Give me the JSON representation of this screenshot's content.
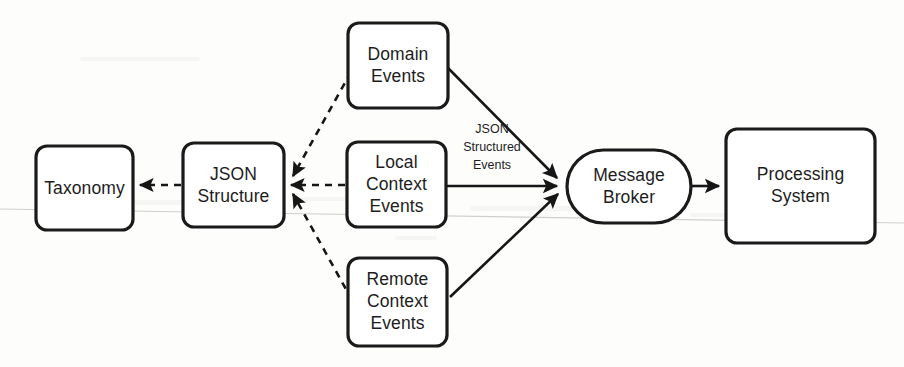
{
  "diagram": {
    "type": "flow-diagram",
    "canvas": {
      "width": 904,
      "height": 367,
      "background": "#fdfdfc"
    },
    "stroke_color": "#161616",
    "fill_color": "#ffffff",
    "nodes": [
      {
        "id": "taxonomy",
        "label": "Taxonomy",
        "lines": [
          "Taxonomy"
        ],
        "shape": "rounded-rect",
        "x": 36,
        "y": 146,
        "w": 97,
        "h": 84
      },
      {
        "id": "json_structure",
        "label": "JSON Structure",
        "lines": [
          "JSON",
          "Structure"
        ],
        "shape": "rounded-rect",
        "x": 183,
        "y": 143,
        "w": 101,
        "h": 84
      },
      {
        "id": "domain_events",
        "label": "Domain Events",
        "lines": [
          "Domain",
          "Events"
        ],
        "shape": "rounded-rect",
        "x": 348,
        "y": 23,
        "w": 100,
        "h": 85
      },
      {
        "id": "local_context_events",
        "label": "Local Context Events",
        "lines": [
          "Local",
          "Context",
          "Events"
        ],
        "shape": "rounded-rect",
        "x": 347,
        "y": 142,
        "w": 99,
        "h": 85
      },
      {
        "id": "remote_context_events",
        "label": "Remote Context Events",
        "lines": [
          "Remote",
          "Context",
          "Events"
        ],
        "shape": "rounded-rect",
        "x": 348,
        "y": 258,
        "w": 99,
        "h": 88
      },
      {
        "id": "message_broker",
        "label": "Message Broker",
        "lines": [
          "Message",
          "Broker"
        ],
        "shape": "stadium",
        "x": 567,
        "y": 150,
        "w": 124,
        "h": 73
      },
      {
        "id": "processing_system",
        "label": "Processing System",
        "lines": [
          "Processing",
          "System"
        ],
        "shape": "rounded-rect",
        "x": 726,
        "y": 129,
        "w": 149,
        "h": 114
      }
    ],
    "edges": [
      {
        "id": "e1",
        "from": "json_structure",
        "to": "taxonomy",
        "style": "dashed",
        "label": ""
      },
      {
        "id": "e2",
        "from": "local_context_events",
        "to": "json_structure",
        "style": "dashed",
        "label": ""
      },
      {
        "id": "e3",
        "from": "domain_events",
        "to": "json_structure",
        "style": "dashed",
        "label": ""
      },
      {
        "id": "e4",
        "from": "remote_context_events",
        "to": "json_structure",
        "style": "dashed",
        "label": ""
      },
      {
        "id": "e5",
        "from": "domain_events",
        "to": "message_broker",
        "style": "solid",
        "label": ""
      },
      {
        "id": "e6",
        "from": "local_context_events",
        "to": "message_broker",
        "style": "solid",
        "label": "JSON Structured Events"
      },
      {
        "id": "e7",
        "from": "remote_context_events",
        "to": "message_broker",
        "style": "solid",
        "label": ""
      },
      {
        "id": "e8",
        "from": "message_broker",
        "to": "processing_system",
        "style": "solid",
        "label": ""
      }
    ],
    "edge_labels": [
      {
        "id": "json_structured_events_label",
        "lines": [
          "JSON",
          "Structured",
          "Events"
        ],
        "x": 492,
        "y": 148
      }
    ]
  }
}
